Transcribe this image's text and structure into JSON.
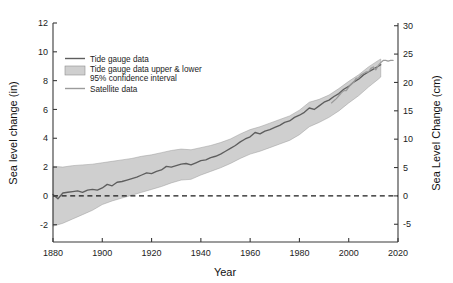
{
  "chart_data": {
    "type": "line",
    "title": "",
    "xlabel": "Year",
    "ylabel": "Sea level change (in)",
    "ylabel_right": "Sea Level Change (cm)",
    "xlim": [
      1880,
      2020
    ],
    "ylim": [
      -3.2,
      12
    ],
    "ylim_right": [
      -8.128,
      30.48
    ],
    "grid": false,
    "legend_position": "upper-left-inside",
    "xticks": [
      1880,
      1900,
      1920,
      1940,
      1960,
      1980,
      2000,
      2020
    ],
    "yticks": [
      -2,
      0,
      2,
      4,
      6,
      8,
      10,
      12
    ],
    "yticks_right": [
      -5,
      0,
      5,
      10,
      15,
      20,
      25,
      30
    ],
    "annotations": [
      {
        "name": "zero-reference-line",
        "type": "hline",
        "y": 0,
        "style": "dashed"
      }
    ],
    "legend": [
      {
        "label": "Tide gauge data",
        "marker": "line",
        "color": "#5e5e5e"
      },
      {
        "label": "Tide gauge data upper & lower",
        "marker": "patch",
        "color": "#cfcfcf"
      },
      {
        "label": "95% confidence interval",
        "marker": "none",
        "color": "#cfcfcf"
      },
      {
        "label": "Satellite data",
        "marker": "line",
        "color": "#9b9b9b"
      }
    ],
    "series": [
      {
        "name": "Tide gauge data",
        "x": [
          1880,
          1882,
          1884,
          1886,
          1888,
          1890,
          1892,
          1894,
          1896,
          1898,
          1900,
          1902,
          1904,
          1906,
          1908,
          1910,
          1912,
          1914,
          1916,
          1918,
          1920,
          1922,
          1924,
          1926,
          1928,
          1930,
          1932,
          1934,
          1936,
          1938,
          1940,
          1942,
          1944,
          1946,
          1948,
          1950,
          1952,
          1954,
          1956,
          1958,
          1960,
          1962,
          1964,
          1966,
          1968,
          1970,
          1972,
          1974,
          1976,
          1978,
          1980,
          1982,
          1984,
          1986,
          1988,
          1990,
          1992,
          1994,
          1996,
          1998,
          2000,
          2002,
          2004,
          2006,
          2008,
          2010,
          2012,
          2013
        ],
        "values": [
          0.1,
          -0.2,
          0.2,
          0.25,
          0.3,
          0.35,
          0.25,
          0.4,
          0.45,
          0.4,
          0.55,
          0.8,
          0.7,
          0.95,
          1.0,
          1.1,
          1.2,
          1.3,
          1.45,
          1.6,
          1.55,
          1.7,
          1.8,
          2.05,
          2.0,
          2.1,
          2.2,
          2.25,
          2.15,
          2.3,
          2.45,
          2.5,
          2.65,
          2.75,
          2.9,
          3.1,
          3.3,
          3.5,
          3.75,
          3.95,
          4.1,
          4.4,
          4.3,
          4.5,
          4.6,
          4.75,
          4.9,
          5.1,
          5.2,
          5.45,
          5.6,
          5.8,
          6.1,
          6.0,
          6.25,
          6.5,
          6.65,
          6.9,
          7.1,
          7.4,
          7.6,
          7.9,
          8.1,
          8.4,
          8.6,
          8.8,
          9.0,
          9.1
        ]
      },
      {
        "name": "Tide gauge upper 95%",
        "x": [
          1880,
          1884,
          1888,
          1892,
          1896,
          1900,
          1904,
          1908,
          1912,
          1916,
          1920,
          1924,
          1928,
          1932,
          1936,
          1940,
          1944,
          1948,
          1952,
          1956,
          1960,
          1964,
          1968,
          1972,
          1976,
          1980,
          1984,
          1988,
          1992,
          1996,
          2000,
          2004,
          2008,
          2012,
          2013
        ],
        "values": [
          2.05,
          2.0,
          2.1,
          2.15,
          2.2,
          2.3,
          2.4,
          2.5,
          2.6,
          2.75,
          2.85,
          3.0,
          3.15,
          3.25,
          3.2,
          3.35,
          3.5,
          3.7,
          3.95,
          4.3,
          4.6,
          4.8,
          5.05,
          5.3,
          5.55,
          5.95,
          6.5,
          6.7,
          7.0,
          7.45,
          7.95,
          8.4,
          8.95,
          9.4,
          9.5
        ]
      },
      {
        "name": "Tide gauge lower 95%",
        "x": [
          1880,
          1884,
          1888,
          1892,
          1896,
          1900,
          1904,
          1908,
          1912,
          1916,
          1920,
          1924,
          1928,
          1932,
          1936,
          1940,
          1944,
          1948,
          1952,
          1956,
          1960,
          1964,
          1968,
          1972,
          1976,
          1980,
          1984,
          1988,
          1992,
          1996,
          2000,
          2004,
          2008,
          2012,
          2013
        ],
        "values": [
          -2.1,
          -1.9,
          -1.6,
          -1.3,
          -1.0,
          -0.6,
          -0.35,
          -0.15,
          0.05,
          0.25,
          0.45,
          0.65,
          0.9,
          1.1,
          1.15,
          1.45,
          1.7,
          1.95,
          2.25,
          2.6,
          2.9,
          3.1,
          3.35,
          3.6,
          3.85,
          4.25,
          4.8,
          5.1,
          5.45,
          5.9,
          6.45,
          6.95,
          7.55,
          8.1,
          8.25
        ]
      },
      {
        "name": "Satellite data",
        "x": [
          1993,
          1994,
          1995,
          1996,
          1997,
          1998,
          1999,
          2000,
          2001,
          2002,
          2003,
          2004,
          2005,
          2006,
          2007,
          2008,
          2009,
          2010,
          2011,
          2012,
          2013,
          2014,
          2015,
          2016,
          2017,
          2018
        ],
        "values": [
          6.45,
          6.6,
          6.75,
          6.95,
          7.15,
          7.3,
          7.3,
          7.55,
          7.75,
          7.9,
          8.15,
          8.2,
          8.4,
          8.5,
          8.6,
          8.6,
          8.85,
          8.95,
          8.75,
          9.05,
          9.25,
          9.4,
          9.4,
          9.35,
          9.4,
          9.4
        ]
      }
    ]
  }
}
